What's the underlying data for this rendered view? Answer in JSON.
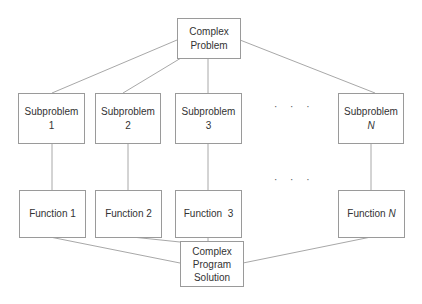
{
  "diagram": {
    "type": "decomposition-tree",
    "top": {
      "line1": "Complex",
      "line2": "Problem"
    },
    "subproblems": [
      {
        "label": "Subproblem",
        "index": "1",
        "italic": false
      },
      {
        "label": "Subproblem",
        "index": "2",
        "italic": false
      },
      {
        "label": "Subproblem",
        "index": "3",
        "italic": false
      },
      {
        "label": "Subproblem",
        "index": "N",
        "italic": true
      }
    ],
    "functions": [
      {
        "label": "Function 1"
      },
      {
        "label": "Function 2"
      },
      {
        "label": "Function  3"
      },
      {
        "label": "Function",
        "index": "N",
        "italic": true
      }
    ],
    "ellipsis": "· · ·",
    "bottom": {
      "line1": "Complex",
      "line2": "Program",
      "line3": "Solution"
    },
    "colors": {
      "line": "#a8a8a8",
      "border": "#9a9a9a",
      "text": "#333333"
    }
  }
}
